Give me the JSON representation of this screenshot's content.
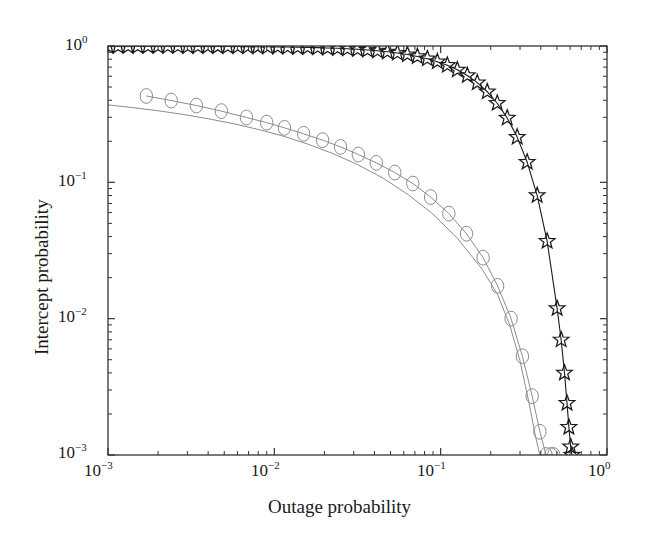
{
  "chart_data": {
    "type": "line",
    "title": "",
    "xlabel": "Outage probability",
    "ylabel": "Intercept probability",
    "xscale": "log",
    "yscale": "log",
    "xlim": [
      0.001,
      1
    ],
    "ylim": [
      0.001,
      1
    ],
    "grid": false,
    "legend": "none",
    "xticks": [
      {
        "value": 0.001,
        "mantissa": "10",
        "exponent": "-3"
      },
      {
        "value": 0.01,
        "mantissa": "10",
        "exponent": "-2"
      },
      {
        "value": 0.1,
        "mantissa": "10",
        "exponent": "-1"
      },
      {
        "value": 1,
        "mantissa": "10",
        "exponent": "0"
      }
    ],
    "yticks": [
      {
        "value": 0.001,
        "mantissa": "10",
        "exponent": "-3"
      },
      {
        "value": 0.01,
        "mantissa": "10",
        "exponent": "-2"
      },
      {
        "value": 0.1,
        "mantissa": "10",
        "exponent": "-1"
      },
      {
        "value": 1,
        "mantissa": "10",
        "exponent": "0"
      }
    ],
    "series": [
      {
        "name": "star-series",
        "marker": "star",
        "color": "#1a1a1a",
        "linewidth": 1.1,
        "x": [
          0.001,
          0.00115,
          0.00132,
          0.00151,
          0.00174,
          0.002,
          0.00229,
          0.00263,
          0.00302,
          0.00347,
          0.00398,
          0.00457,
          0.00525,
          0.00603,
          0.00692,
          0.00794,
          0.00912,
          0.01047,
          0.01202,
          0.0138,
          0.01585,
          0.0182,
          0.02089,
          0.02399,
          0.02754,
          0.03162,
          0.03631,
          0.04169,
          0.04786,
          0.05495,
          0.0631,
          0.07244,
          0.08318,
          0.0955,
          0.10965,
          0.12589,
          0.14454,
          0.16596,
          0.19055,
          0.21878,
          0.25119,
          0.2884,
          0.33113,
          0.38019,
          0.43652,
          0.50119,
          0.53,
          0.555,
          0.575,
          0.59,
          0.605,
          0.615
        ],
        "y": [
          0.997,
          0.9968,
          0.9966,
          0.9964,
          0.9961,
          0.9958,
          0.9955,
          0.9951,
          0.9946,
          0.9941,
          0.9935,
          0.9928,
          0.992,
          0.991,
          0.9899,
          0.9886,
          0.987,
          0.9851,
          0.9828,
          0.98,
          0.9766,
          0.9725,
          0.9675,
          0.9615,
          0.9542,
          0.9454,
          0.9348,
          0.922,
          0.9065,
          0.8879,
          0.8654,
          0.8384,
          0.8061,
          0.7676,
          0.7221,
          0.6689,
          0.6076,
          0.5383,
          0.4619,
          0.3802,
          0.2963,
          0.2147,
          0.1408,
          0.0802,
          0.037,
          0.0119,
          0.007,
          0.004,
          0.0024,
          0.0016,
          0.00115,
          0.001
        ]
      },
      {
        "name": "circle-series",
        "marker": "circle",
        "color": "#8c8c8c",
        "linewidth": 1.0,
        "x": [
          0.0017,
          0.0024,
          0.0034,
          0.0048,
          0.0068,
          0.009,
          0.0115,
          0.015,
          0.0195,
          0.025,
          0.032,
          0.041,
          0.053,
          0.068,
          0.087,
          0.112,
          0.143,
          0.18,
          0.22,
          0.265,
          0.31,
          0.355,
          0.395,
          0.43,
          0.46,
          0.478
        ],
        "y": [
          0.43,
          0.398,
          0.366,
          0.333,
          0.299,
          0.274,
          0.251,
          0.227,
          0.204,
          0.182,
          0.16,
          0.139,
          0.118,
          0.098,
          0.078,
          0.059,
          0.042,
          0.028,
          0.0174,
          0.01,
          0.0053,
          0.0027,
          0.00148,
          0.00088,
          0.001,
          0.001
        ]
      },
      {
        "name": "plain-line-series",
        "marker": "none",
        "color": "#8c8c8c",
        "linewidth": 1.0,
        "x": [
          0.001,
          0.00141,
          0.002,
          0.00282,
          0.00398,
          0.00562,
          0.00794,
          0.01122,
          0.01585,
          0.02239,
          0.03162,
          0.04467,
          0.0631,
          0.08913,
          0.12589,
          0.17783,
          0.22,
          0.26,
          0.3,
          0.34,
          0.37,
          0.395,
          0.415,
          0.43
        ],
        "y": [
          0.37,
          0.353,
          0.335,
          0.315,
          0.293,
          0.27,
          0.245,
          0.219,
          0.191,
          0.163,
          0.135,
          0.108,
          0.082,
          0.059,
          0.039,
          0.023,
          0.015,
          0.009,
          0.0049,
          0.0024,
          0.0014,
          0.0009,
          0.001,
          0.001
        ]
      }
    ],
    "axes_geometry": {
      "left": 108,
      "right": 607,
      "top": 46,
      "bottom": 455,
      "frame_color": "#333333"
    }
  }
}
